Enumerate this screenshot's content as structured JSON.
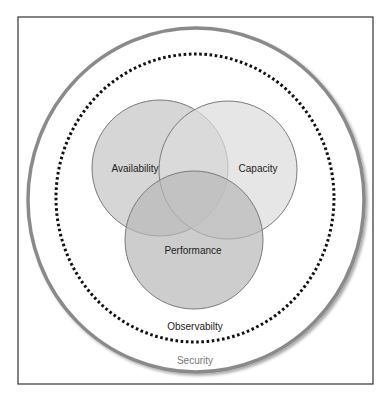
{
  "diagram": {
    "type": "nested-venn",
    "frame": {
      "x": 18,
      "y": 17,
      "width": 355,
      "height": 367,
      "stroke": "#333333"
    },
    "outer_ring": {
      "label": "Security",
      "cx": 196,
      "cy": 200,
      "rx": 168,
      "ry": 172,
      "stroke": "#8a8a8a"
    },
    "dotted_ring": {
      "label": "Observabilty",
      "cx": 195,
      "cy": 198,
      "rx": 139,
      "ry": 144,
      "stroke": "#111111"
    },
    "circles": [
      {
        "label": "Availability",
        "cx": 160,
        "cy": 168,
        "r": 68,
        "fill": "#cfcfcf"
      },
      {
        "label": "Capacity",
        "cx": 228,
        "cy": 170,
        "r": 69,
        "fill": "#dcdcdc"
      },
      {
        "label": "Performance",
        "cx": 194,
        "cy": 240,
        "r": 69,
        "fill": "#c2c2c2"
      }
    ],
    "circle_stroke": "#7a7a7a",
    "triple_overlap_fill": "#b0b0b0"
  }
}
